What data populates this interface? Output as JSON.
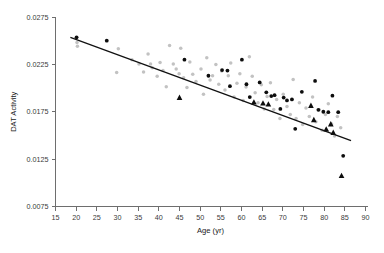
{
  "chart_data": {
    "type": "scatter",
    "title": "",
    "xlabel": "Age (yr)",
    "ylabel": "DAT Activity",
    "xlim": [
      15,
      90
    ],
    "ylim": [
      0.0075,
      0.0275
    ],
    "xticks": [
      15,
      20,
      25,
      30,
      35,
      40,
      45,
      50,
      55,
      60,
      65,
      70,
      75,
      80,
      85,
      90
    ],
    "yticks": [
      0.0075,
      0.0125,
      0.0175,
      0.0225,
      0.0275
    ],
    "xtick_labels": [
      "15",
      "20",
      "25",
      "30",
      "35",
      "40",
      "45",
      "50",
      "55",
      "60",
      "65",
      "70",
      "75",
      "80",
      "85",
      "90"
    ],
    "ytick_labels": [
      "0.0075",
      "0.0125",
      "0.0175",
      "0.0225",
      "0.0275"
    ],
    "grid": false,
    "legend": "none",
    "colors": {
      "light_circle": "#c2c2c2",
      "dark_circle": "#0d0d0d",
      "dark_triangle": "#0d0d0d",
      "fit_line": "#111111",
      "axis": "#6e6e6e",
      "background": "#ffffff"
    },
    "trendline": {
      "type": "linear",
      "x_start": 18.6,
      "y_start": 0.02535,
      "x_end": 86.5,
      "y_end": 0.01445,
      "slope": -0.0001605,
      "intercept": 0.028335
    },
    "series": [
      {
        "name": "light-circles",
        "marker": "circle",
        "color": "#c2c2c2",
        "points": [
          [
            20.2,
            0.0248
          ],
          [
            20.3,
            0.0244
          ],
          [
            29.8,
            0.02165
          ],
          [
            30.2,
            0.02415
          ],
          [
            33.5,
            0.023
          ],
          [
            35.2,
            0.02255
          ],
          [
            36.3,
            0.0217
          ],
          [
            37.4,
            0.0236
          ],
          [
            38.0,
            0.02255
          ],
          [
            38.4,
            0.02215
          ],
          [
            39.6,
            0.02125
          ],
          [
            40.3,
            0.0227
          ],
          [
            41.0,
            0.02185
          ],
          [
            41.8,
            0.02015
          ],
          [
            42.6,
            0.0245
          ],
          [
            43.5,
            0.02255
          ],
          [
            44.2,
            0.022
          ],
          [
            44.9,
            0.0215
          ],
          [
            45.3,
            0.0242
          ],
          [
            46.0,
            0.0211
          ],
          [
            46.8,
            0.02005
          ],
          [
            47.5,
            0.02275
          ],
          [
            48.2,
            0.02145
          ],
          [
            49.0,
            0.0207
          ],
          [
            50.2,
            0.022
          ],
          [
            50.8,
            0.01935
          ],
          [
            51.6,
            0.0232
          ],
          [
            52.4,
            0.02085
          ],
          [
            53.0,
            0.0213
          ],
          [
            53.8,
            0.0225
          ],
          [
            54.5,
            0.0204
          ],
          [
            55.2,
            0.0218
          ],
          [
            56.0,
            0.0198
          ],
          [
            56.8,
            0.0213
          ],
          [
            57.4,
            0.02265
          ],
          [
            58.2,
            0.01905
          ],
          [
            58.9,
            0.0205
          ],
          [
            59.6,
            0.0215
          ],
          [
            60.4,
            0.0187
          ],
          [
            61.1,
            0.0201
          ],
          [
            61.9,
            0.0233
          ],
          [
            62.6,
            0.02125
          ],
          [
            63.3,
            0.0195
          ],
          [
            64.0,
            0.01845
          ],
          [
            64.8,
            0.02035
          ],
          [
            65.5,
            0.0178
          ],
          [
            66.2,
            0.0191
          ],
          [
            67.0,
            0.02055
          ],
          [
            67.8,
            0.01775
          ],
          [
            68.5,
            0.0188
          ],
          [
            69.3,
            0.0168
          ],
          [
            70.1,
            0.01935
          ],
          [
            71.0,
            0.01805
          ],
          [
            71.8,
            0.0172
          ],
          [
            72.5,
            0.0209
          ],
          [
            73.2,
            0.0168
          ],
          [
            74.0,
            0.01845
          ],
          [
            74.8,
            0.01615
          ],
          [
            75.6,
            0.0179
          ],
          [
            76.4,
            0.017
          ],
          [
            77.2,
            0.01905
          ],
          [
            78.0,
            0.01645
          ],
          [
            78.8,
            0.0177
          ],
          [
            79.5,
            0.01555
          ],
          [
            80.3,
            0.0172
          ],
          [
            81.0,
            0.01835
          ],
          [
            81.8,
            0.0162
          ],
          [
            82.5,
            0.01495
          ],
          [
            83.2,
            0.017
          ],
          [
            84.0,
            0.0158
          ]
        ]
      },
      {
        "name": "dark-circles",
        "marker": "circle",
        "color": "#0d0d0d",
        "points": [
          [
            20.1,
            0.02535
          ],
          [
            27.4,
            0.025
          ],
          [
            46.2,
            0.023
          ],
          [
            52.0,
            0.0213
          ],
          [
            55.3,
            0.0219
          ],
          [
            56.6,
            0.02185
          ],
          [
            57.2,
            0.0202
          ],
          [
            60.1,
            0.023
          ],
          [
            61.2,
            0.0204
          ],
          [
            62.0,
            0.01905
          ],
          [
            64.4,
            0.0206
          ],
          [
            66.0,
            0.01955
          ],
          [
            67.2,
            0.01915
          ],
          [
            68.0,
            0.01925
          ],
          [
            69.4,
            0.0178
          ],
          [
            70.2,
            0.019
          ],
          [
            71.0,
            0.0187
          ],
          [
            72.2,
            0.0188
          ],
          [
            73.0,
            0.0157
          ],
          [
            74.6,
            0.0196
          ],
          [
            77.8,
            0.02075
          ],
          [
            78.6,
            0.0177
          ],
          [
            79.8,
            0.0175
          ],
          [
            81.0,
            0.01745
          ],
          [
            82.0,
            0.0192
          ],
          [
            83.4,
            0.01745
          ],
          [
            84.6,
            0.01285
          ]
        ]
      },
      {
        "name": "dark-triangles",
        "marker": "triangle",
        "color": "#0d0d0d",
        "points": [
          [
            45.0,
            0.019
          ],
          [
            63.0,
            0.0185
          ],
          [
            65.2,
            0.0184
          ],
          [
            66.5,
            0.0183
          ],
          [
            76.8,
            0.01815
          ],
          [
            77.5,
            0.01665
          ],
          [
            80.5,
            0.01565
          ],
          [
            81.6,
            0.0162
          ],
          [
            82.2,
            0.0153
          ],
          [
            84.2,
            0.01075
          ]
        ]
      }
    ]
  }
}
